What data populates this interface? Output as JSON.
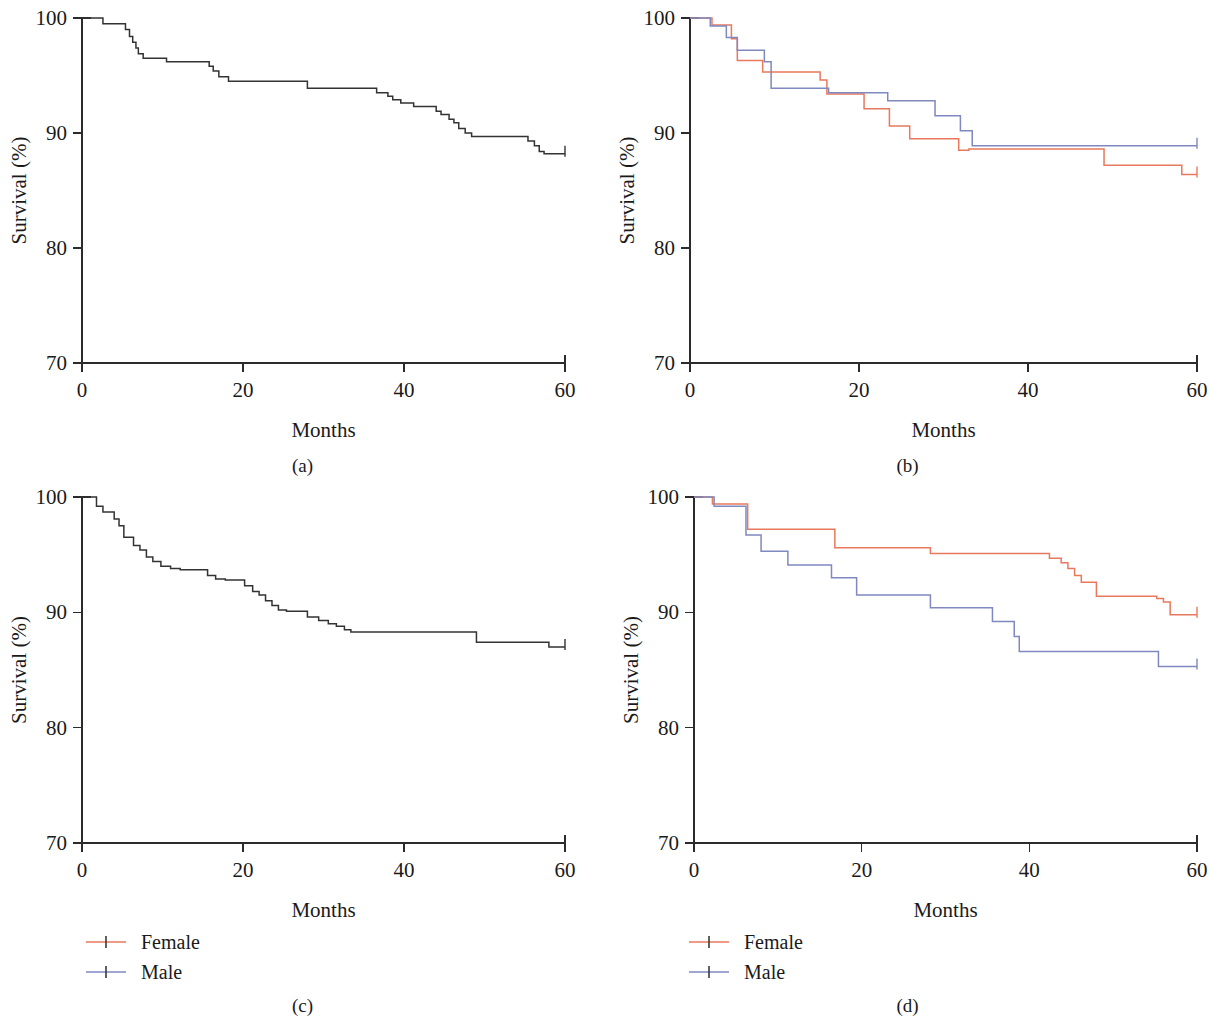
{
  "figure": {
    "type": "multi-panel-kaplan-meier",
    "panel_count": 4,
    "background": "#ffffff",
    "axis_color": "#2b2b2b",
    "text_color": "#1a1a1a"
  },
  "colors": {
    "female": "#e8795c",
    "male": "#7f88bf",
    "overall": "#333333"
  },
  "legend": {
    "female_label": "Female",
    "male_label": "Male",
    "marker": "censor-plus-tick"
  },
  "chart_data": [
    {
      "id": "panel-a",
      "type": "line",
      "subtype": "kaplan-meier-step",
      "caption": "(a)",
      "title": "",
      "xlabel": "Months",
      "ylabel": "Survival (%)",
      "xlim": [
        0,
        60
      ],
      "ylim": [
        70,
        100
      ],
      "xticks": [
        0,
        20,
        40,
        60
      ],
      "yticks": [
        70,
        80,
        90,
        100
      ],
      "xticklabels": [
        "0",
        "20",
        "40",
        "60"
      ],
      "yticklabels": [
        "70",
        "80",
        "90",
        "100"
      ],
      "grid": false,
      "legend": false,
      "legend_position": "none",
      "series": [
        {
          "name": "Overall",
          "color": "#333333",
          "x": [
            0,
            1.2,
            2.6,
            3.4,
            5.4,
            5.9,
            6.3,
            6.7,
            7.0,
            7.6,
            8.6,
            10.5,
            15.2,
            15.8,
            16.3,
            17.0,
            18.2,
            27.4,
            28.0,
            35.0,
            36.6,
            38.0,
            38.6,
            39.6,
            41.2,
            42.4,
            44.0,
            44.6,
            45.6,
            46.2,
            46.8,
            47.6,
            48.4,
            49.0,
            54.2,
            55.4,
            56.2,
            56.8,
            57.4,
            60
          ],
          "y": [
            100,
            100,
            99.5,
            99.5,
            99.0,
            98.4,
            97.9,
            97.4,
            96.9,
            96.5,
            96.5,
            96.2,
            96.2,
            95.8,
            95.4,
            94.9,
            94.5,
            94.5,
            93.9,
            93.9,
            93.5,
            93.2,
            92.9,
            92.6,
            92.3,
            92.3,
            91.9,
            91.6,
            91.2,
            90.9,
            90.4,
            90.0,
            89.7,
            89.7,
            89.7,
            89.3,
            88.9,
            88.4,
            88.2,
            88.2
          ]
        }
      ]
    },
    {
      "id": "panel-b",
      "type": "line",
      "subtype": "kaplan-meier-step",
      "caption": "(b)",
      "title": "",
      "xlabel": "Months",
      "ylabel": "Survival (%)",
      "xlim": [
        0,
        60
      ],
      "ylim": [
        70,
        100
      ],
      "xticks": [
        0,
        20,
        40,
        60
      ],
      "yticks": [
        70,
        80,
        90,
        100
      ],
      "xticklabels": [
        "0",
        "20",
        "40",
        "60"
      ],
      "yticklabels": [
        "70",
        "80",
        "90",
        "100"
      ],
      "grid": false,
      "legend": false,
      "legend_position": "none",
      "series": [
        {
          "name": "Female",
          "color": "#e8795c",
          "x": [
            0,
            1.4,
            2.6,
            4.2,
            4.9,
            5.6,
            7.4,
            8.6,
            9.8,
            14.2,
            15.4,
            16.2,
            19.8,
            20.6,
            22.4,
            23.6,
            25.2,
            26.0,
            30.6,
            31.8,
            33.0,
            48.2,
            49.0,
            57.4,
            58.2,
            60
          ],
          "y": [
            100,
            100,
            99.4,
            99.4,
            98.2,
            96.3,
            96.3,
            95.3,
            95.3,
            95.3,
            94.6,
            93.4,
            93.4,
            92.1,
            92.1,
            90.6,
            90.6,
            89.5,
            89.5,
            88.5,
            88.6,
            88.6,
            87.2,
            87.2,
            86.4,
            86.4
          ]
        },
        {
          "name": "Male",
          "color": "#7f88bf",
          "x": [
            0,
            1.6,
            2.4,
            3.6,
            4.3,
            5.0,
            5.6,
            6.2,
            7.6,
            8.8,
            9.6,
            15.4,
            16.4,
            22.4,
            23.4,
            28.0,
            29.0,
            31.0,
            32.0,
            33.4,
            60
          ],
          "y": [
            100,
            100,
            99.3,
            99.3,
            98.3,
            98.3,
            97.2,
            97.2,
            97.2,
            96.2,
            93.9,
            93.9,
            93.5,
            93.5,
            92.8,
            92.8,
            91.5,
            91.5,
            90.2,
            88.9,
            88.9
          ]
        }
      ]
    },
    {
      "id": "panel-c",
      "type": "line",
      "subtype": "kaplan-meier-step",
      "caption": "(c)",
      "title": "",
      "xlabel": "Months",
      "ylabel": "Survival (%)",
      "xlim": [
        0,
        60
      ],
      "ylim": [
        70,
        100
      ],
      "xticks": [
        0,
        20,
        40,
        60
      ],
      "yticks": [
        70,
        80,
        90,
        100
      ],
      "xticklabels": [
        "0",
        "20",
        "40",
        "60"
      ],
      "yticklabels": [
        "70",
        "80",
        "90",
        "100"
      ],
      "grid": false,
      "legend": true,
      "legend_position": "below-left",
      "series": [
        {
          "name": "Overall",
          "color": "#333333",
          "x": [
            0,
            1.0,
            1.8,
            2.6,
            3.4,
            4.0,
            4.6,
            5.2,
            5.8,
            6.4,
            7.2,
            8.0,
            8.8,
            9.8,
            11.0,
            12.2,
            14.8,
            15.6,
            16.6,
            17.8,
            19.0,
            20.2,
            21.2,
            22.0,
            22.8,
            23.6,
            24.4,
            25.4,
            27.0,
            28.0,
            29.4,
            30.6,
            31.6,
            32.6,
            33.4,
            48.2,
            49.0,
            57.2,
            58.0,
            60
          ],
          "y": [
            100,
            100,
            99.2,
            98.7,
            98.7,
            98.1,
            97.5,
            96.5,
            96.5,
            95.8,
            95.4,
            94.8,
            94.4,
            94.0,
            93.8,
            93.7,
            93.7,
            93.2,
            92.9,
            92.8,
            92.8,
            92.3,
            91.8,
            91.5,
            91.0,
            90.6,
            90.2,
            90.1,
            90.1,
            89.6,
            89.3,
            89.0,
            88.8,
            88.5,
            88.3,
            88.3,
            87.4,
            87.4,
            87.0,
            87.0
          ]
        }
      ]
    },
    {
      "id": "panel-d",
      "type": "line",
      "subtype": "kaplan-meier-step",
      "caption": "(d)",
      "title": "",
      "xlabel": "Months",
      "ylabel": "Survival (%)",
      "xlim": [
        0,
        60
      ],
      "ylim": [
        70,
        100
      ],
      "xticks": [
        0,
        20,
        40,
        60
      ],
      "yticks": [
        70,
        80,
        90,
        100
      ],
      "xticklabels": [
        "0",
        "20",
        "40",
        "60"
      ],
      "yticklabels": [
        "70",
        "80",
        "90",
        "100"
      ],
      "grid": false,
      "legend": true,
      "legend_position": "below-left",
      "series": [
        {
          "name": "Female",
          "color": "#e8795c",
          "x": [
            0,
            1.4,
            2.2,
            3.2,
            5.8,
            6.4,
            16.0,
            16.8,
            27.4,
            28.2,
            41.6,
            42.4,
            43.8,
            44.6,
            45.4,
            46.2,
            47.2,
            48.0,
            54.4,
            55.2,
            56.0,
            56.8,
            60
          ],
          "y": [
            100,
            100,
            99.4,
            99.4,
            99.4,
            97.2,
            97.2,
            95.6,
            95.6,
            95.1,
            95.1,
            94.7,
            94.3,
            93.8,
            93.2,
            92.6,
            92.6,
            91.4,
            91.4,
            91.2,
            90.9,
            89.8,
            89.8
          ]
        },
        {
          "name": "Male",
          "color": "#7f88bf",
          "x": [
            0,
            1.5,
            2.4,
            3.4,
            5.6,
            6.2,
            7.2,
            8.0,
            10.4,
            11.2,
            15.6,
            16.4,
            18.6,
            19.4,
            27.4,
            28.2,
            34.8,
            35.6,
            37.4,
            38.2,
            38.8,
            54.6,
            55.4,
            60
          ],
          "y": [
            100,
            100,
            99.2,
            99.2,
            99.2,
            96.7,
            96.7,
            95.3,
            95.3,
            94.1,
            94.1,
            93.0,
            93.0,
            91.5,
            91.5,
            90.4,
            90.4,
            89.2,
            89.2,
            87.9,
            86.6,
            86.6,
            85.3,
            85.3
          ]
        }
      ],
      "censor_marks": {
        "female": [
          {
            "x": 28.2,
            "y": 95.1
          },
          {
            "x": 48.0,
            "y": 91.4
          },
          {
            "x": 55.2,
            "y": 91.2
          },
          {
            "x": 60,
            "y": 89.8
          }
        ],
        "male": [
          {
            "x": 19.4,
            "y": 91.5
          },
          {
            "x": 38.8,
            "y": 86.6
          },
          {
            "x": 60,
            "y": 85.3
          }
        ]
      }
    }
  ]
}
